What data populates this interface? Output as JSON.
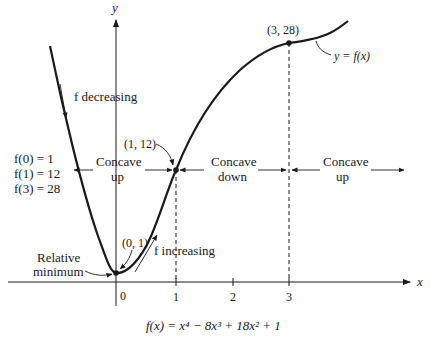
{
  "diagram": {
    "axes": {
      "x_label": "x",
      "y_label": "y",
      "x_ticks": [
        {
          "label": "0",
          "value": 0
        },
        {
          "label": "1",
          "value": 1
        },
        {
          "label": "2",
          "value": 2
        },
        {
          "label": "3",
          "value": 3
        }
      ]
    },
    "curve_label": "y = f(x)",
    "function_caption": "f(x) = x⁴ − 8x³ + 18x² + 1",
    "points": [
      {
        "label": "(0, 1)",
        "x": 0,
        "y": 1,
        "annotation": "Relative minimum"
      },
      {
        "label": "(1, 12)",
        "x": 1,
        "y": 12
      },
      {
        "label": "(3, 28)",
        "x": 3,
        "y": 28
      }
    ],
    "values_list": [
      "f(0) = 1",
      "f(1) = 12",
      "f(3) = 28"
    ],
    "relative_min_label": [
      "Relative",
      "minimum"
    ],
    "monotonic_labels": {
      "decreasing": "f decreasing",
      "increasing": "f increasing"
    },
    "concavity_regions": [
      {
        "line1": "Concave",
        "line2": "up",
        "interval": "x < 1"
      },
      {
        "line1": "Concave",
        "line2": "down",
        "interval": "1 < x < 3"
      },
      {
        "line1": "Concave",
        "line2": "up",
        "interval": "x > 3"
      }
    ],
    "colors": {
      "ink": "#1a1a1a",
      "background": "#ffffff"
    }
  }
}
